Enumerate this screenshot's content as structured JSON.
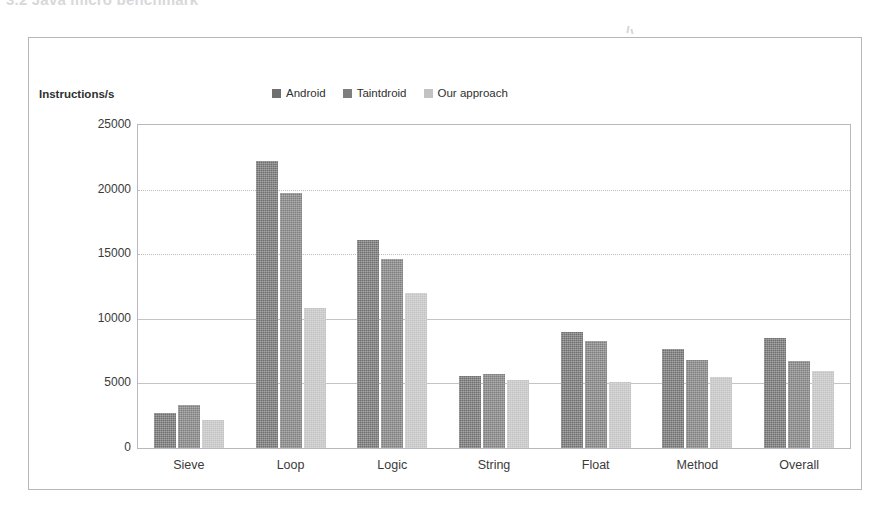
{
  "page": {
    "caption_fragment": "3.2 Java micro benchmark"
  },
  "chart": {
    "axis_title": "Instructions/s",
    "legend": [
      {
        "label": "Android",
        "color": "#6f6f6f"
      },
      {
        "label": "Taintdroid",
        "color": "#7e7e7e"
      },
      {
        "label": "Our approach",
        "color": "#c2c2c2"
      }
    ]
  },
  "chart_data": {
    "type": "bar",
    "title": "",
    "xlabel": "",
    "ylabel": "Instructions/s",
    "ylim": [
      0,
      25000
    ],
    "yticks": [
      0,
      5000,
      10000,
      15000,
      20000,
      25000
    ],
    "ytick_labels": [
      "0",
      "5000",
      "10000",
      "15000",
      "20000",
      "25000"
    ],
    "grid": true,
    "legend_position": "top-center",
    "categories": [
      "Sieve",
      "Loop",
      "Logic",
      "String",
      "Float",
      "Method",
      "Overall"
    ],
    "series": [
      {
        "name": "Android",
        "color": "#6f6f6f",
        "values": [
          2700,
          22200,
          16100,
          5600,
          8950,
          7650,
          8500
        ]
      },
      {
        "name": "Taintdroid",
        "color": "#7e7e7e",
        "values": [
          3300,
          19700,
          14600,
          5750,
          8300,
          6850,
          6700
        ]
      },
      {
        "name": "Our approach",
        "color": "#c2c2c2",
        "values": [
          2200,
          10850,
          12000,
          5300,
          5100,
          5500,
          5950
        ]
      }
    ]
  }
}
